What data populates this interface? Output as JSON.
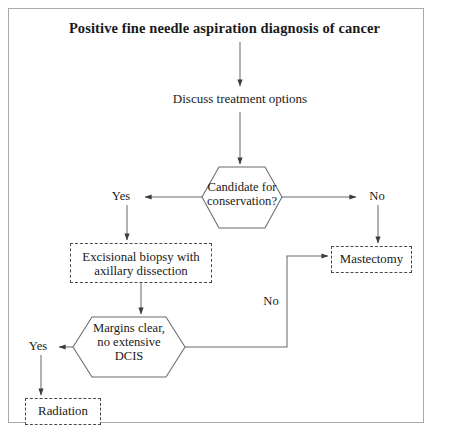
{
  "diagram": {
    "title": "Positive fine needle aspiration diagnosis of cancer",
    "nodes": {
      "start": "Positive fine needle aspiration diagnosis of cancer",
      "discuss": "Discuss treatment options",
      "decision1": "Candidate for\nconservation?",
      "excisional": "Excisional biopsy with\naxillary dissection",
      "mastectomy": "Mastectomy",
      "decision2": "Margins clear,\nno extensive\nDCIS",
      "radiation": "Radiation"
    },
    "edges": {
      "yes1": "Yes",
      "no1": "No",
      "yes2": "Yes",
      "no2": "No"
    },
    "colors": {
      "frame": "#a9a9a9",
      "stroke": "#4a4a4a",
      "text": "#1a1a1a",
      "background": "#ffffff"
    }
  }
}
